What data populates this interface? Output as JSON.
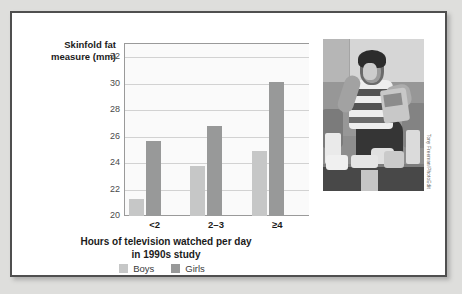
{
  "figure": {
    "photo_credit": "Tony Freeman/PhotoEdit",
    "photo_alt": "boy-eating-snacks-on-couch-photo"
  },
  "chart_data": {
    "type": "bar",
    "title": "",
    "categories": [
      "<2",
      "2–3",
      "≥4"
    ],
    "series": [
      {
        "name": "Boys",
        "values": [
          21.3,
          23.8,
          24.9
        ],
        "color": "#c6c7c7"
      },
      {
        "name": "Girls",
        "values": [
          25.7,
          26.8,
          30.1
        ],
        "color": "#989999"
      }
    ],
    "ylabel": "Skinfold fat measure (mm)",
    "xlabel": "Hours of television watched per day in 1990s study",
    "xlabel_line1": "Hours of television watched per day",
    "xlabel_line2": "in 1990s study",
    "ylim": [
      20,
      33
    ],
    "yticks": [
      20,
      22,
      24,
      26,
      28,
      30,
      32
    ],
    "ytick_labels": [
      "20",
      "22",
      "24",
      "26",
      "28",
      "30",
      "32"
    ],
    "grid": true,
    "legend_position": "bottom"
  }
}
